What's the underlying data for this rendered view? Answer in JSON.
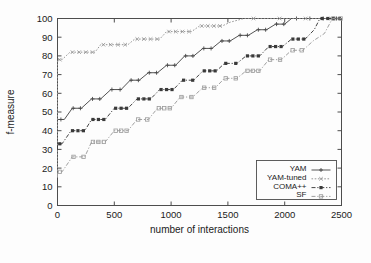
{
  "chart_data": {
    "type": "line",
    "title": "",
    "xlabel": "number of interactions",
    "ylabel": "f-measure",
    "xlim": [
      0,
      2500
    ],
    "ylim": [
      0,
      100
    ],
    "xticks": [
      0,
      500,
      1000,
      1500,
      2000,
      2500
    ],
    "yticks": [
      0,
      10,
      20,
      30,
      40,
      50,
      60,
      70,
      80,
      90,
      100
    ],
    "grid": false,
    "legend_position": "bottom-right",
    "line_style": "step-post",
    "series": [
      {
        "name": "YAM",
        "color": "#4a4a4a",
        "marker": "plus",
        "dash": "solid",
        "x": [
          0,
          0,
          60,
          130,
          210,
          300,
          380,
          470,
          560,
          640,
          720,
          800,
          880,
          960,
          1040,
          1120,
          1200,
          1280,
          1360,
          1440,
          1520,
          1600,
          1680,
          1760,
          1840,
          1920,
          2000,
          2060,
          2500
        ],
        "y": [
          30,
          46,
          46,
          52,
          52,
          57,
          57,
          62,
          62,
          67,
          67,
          71,
          71,
          75,
          75,
          80,
          80,
          84,
          84,
          88,
          88,
          91,
          91,
          94,
          94,
          97,
          97,
          100,
          100
        ]
      },
      {
        "name": "YAM-tuned",
        "color": "#8f8f8f",
        "marker": "cross",
        "dash": "dotted",
        "x": [
          0,
          0,
          40,
          110,
          330,
          380,
          620,
          680,
          900,
          960,
          1180,
          1250,
          1450,
          1520,
          1640,
          2500
        ],
        "y": [
          15,
          78,
          78,
          82,
          82,
          86,
          86,
          89,
          89,
          93,
          93,
          96,
          96,
          98,
          100,
          100
        ]
      },
      {
        "name": "COMA++",
        "color": "#3a3a3a",
        "marker": "square-filled",
        "dash": "dashdot",
        "x": [
          0,
          0,
          40,
          120,
          240,
          300,
          420,
          500,
          620,
          700,
          820,
          900,
          1020,
          1100,
          1200,
          1280,
          1400,
          1470,
          1580,
          1660,
          1780,
          1860,
          1980,
          2060,
          2180,
          2260,
          2310,
          2500
        ],
        "y": [
          30,
          33,
          33,
          40,
          40,
          46,
          46,
          52,
          52,
          57,
          57,
          62,
          62,
          67,
          67,
          72,
          72,
          76,
          76,
          80,
          80,
          85,
          85,
          89,
          89,
          94,
          100,
          100
        ]
      },
      {
        "name": "SF",
        "color": "#9a9a9a",
        "marker": "square-open",
        "dash": "dashdot",
        "x": [
          0,
          0,
          40,
          130,
          240,
          300,
          420,
          500,
          620,
          700,
          800,
          880,
          1000,
          1080,
          1190,
          1280,
          1390,
          1470,
          1580,
          1660,
          1780,
          1860,
          1970,
          2060,
          2160,
          2250,
          2350,
          2420,
          2500
        ],
        "y": [
          15,
          18,
          18,
          26,
          26,
          34,
          34,
          40,
          40,
          46,
          46,
          52,
          52,
          58,
          58,
          63,
          63,
          68,
          68,
          72,
          72,
          78,
          78,
          83,
          83,
          88,
          92,
          100,
          100
        ]
      }
    ],
    "legend_entries": [
      "YAM",
      "YAM-tuned",
      "COMA++",
      "SF"
    ]
  },
  "axes": {
    "x_label": "number of interactions",
    "y_label": "f-measure",
    "x_tick_labels": [
      "0",
      "500",
      "1000",
      "1500",
      "2000",
      "2500"
    ],
    "y_tick_labels": [
      "0",
      "10",
      "20",
      "30",
      "40",
      "50",
      "60",
      "70",
      "80",
      "90",
      "100"
    ]
  },
  "legend": {
    "items": [
      {
        "label": "YAM"
      },
      {
        "label": "YAM-tuned"
      },
      {
        "label": "COMA++"
      },
      {
        "label": "SF"
      }
    ]
  },
  "colors": {
    "frame": "#4d4d4d",
    "text": "#1b1b1b",
    "background": "#fdfdfd"
  }
}
